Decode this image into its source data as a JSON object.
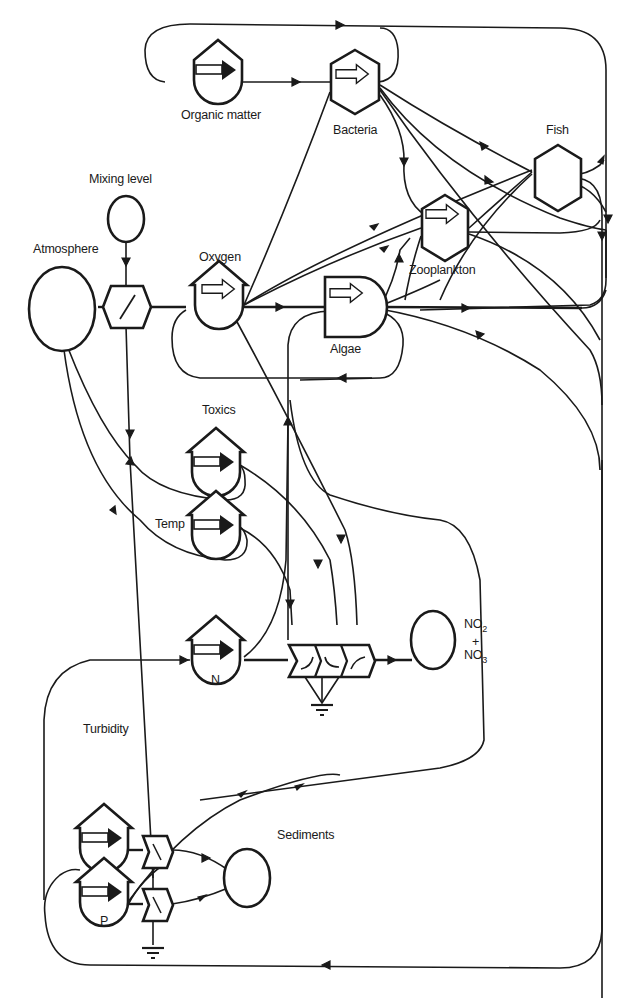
{
  "diagram": {
    "type": "energy-circuit / ecosystem flow diagram",
    "colors": {
      "line": "#1a1a1a",
      "background": "#ffffff"
    },
    "nodes": [
      {
        "id": "organic_matter",
        "label": "Organic matter",
        "symbol": "storage-tank-with-arrow"
      },
      {
        "id": "bacteria",
        "label": "Bacteria",
        "symbol": "consumer-hexagon-with-arrow"
      },
      {
        "id": "fish",
        "label": "Fish",
        "symbol": "consumer-hexagon"
      },
      {
        "id": "mixing_level",
        "label": "Mixing level",
        "symbol": "source-circle"
      },
      {
        "id": "atmosphere",
        "label": "Atmosphere",
        "symbol": "source-circle"
      },
      {
        "id": "oxygen",
        "label": "Oxygen",
        "symbol": "storage-tank-with-arrow"
      },
      {
        "id": "zooplankton",
        "label": "Zooplankton",
        "symbol": "consumer-hexagon-with-arrow"
      },
      {
        "id": "algae",
        "label": "Algae",
        "symbol": "producer-bullet-with-arrow"
      },
      {
        "id": "toxics",
        "label": "Toxics",
        "symbol": "storage-tank-with-arrow"
      },
      {
        "id": "temp",
        "label": "Temp",
        "symbol": "storage-tank-with-arrow"
      },
      {
        "id": "n",
        "label": "N",
        "symbol": "storage-tank-with-arrow"
      },
      {
        "id": "no2_no3",
        "label_top": "NO",
        "sub_top": "2",
        "label_plus": "+",
        "label_bottom": "NO",
        "sub_bottom": "3",
        "symbol": "source-circle"
      },
      {
        "id": "turbidity",
        "label": "Turbidity",
        "symbol": "storage-tank-with-arrow"
      },
      {
        "id": "p",
        "label": "P",
        "symbol": "storage-tank-with-arrow"
      },
      {
        "id": "sediments",
        "label": "Sediments",
        "symbol": "source-circle"
      }
    ],
    "interactions": [
      {
        "id": "reaeration_gate",
        "symbol": "hexagon-interaction",
        "between": [
          "atmosphere",
          "oxygen"
        ]
      },
      {
        "id": "nitrification_gates",
        "symbol": "triple-interaction",
        "count": 3
      },
      {
        "id": "turbidity_gate",
        "symbol": "interaction"
      },
      {
        "id": "p_gate",
        "symbol": "interaction"
      }
    ]
  }
}
